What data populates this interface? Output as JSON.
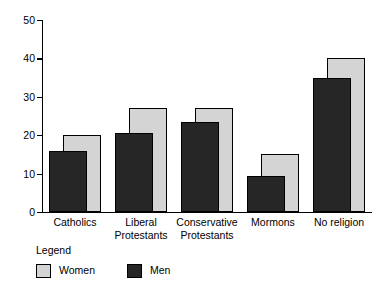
{
  "chart_data": {
    "type": "bar",
    "title": "",
    "subtitle": "",
    "xlabel": "",
    "ylabel": "",
    "ylim": [
      0,
      50
    ],
    "yticks": [
      0,
      10,
      20,
      30,
      40,
      50
    ],
    "grid": false,
    "legend_position": "below-left",
    "legend_title": "Legend",
    "categories": [
      "Catholics",
      "Liberal Protestants",
      "Conservative Protestants",
      "Mormons",
      "No religion"
    ],
    "category_lines": [
      [
        "Catholics"
      ],
      [
        "Liberal",
        "Protestants"
      ],
      [
        "Conservative",
        "Protestants"
      ],
      [
        "Mormons"
      ],
      [
        "No religion"
      ]
    ],
    "series": [
      {
        "name": "Women",
        "color": "#d4d4d4",
        "values": [
          20,
          27,
          27,
          15,
          40
        ]
      },
      {
        "name": "Men",
        "color": "#262626",
        "values": [
          16,
          20.5,
          23.5,
          9.3,
          34.8
        ]
      }
    ]
  },
  "axis": {
    "y_tick_labels": [
      "0",
      "10",
      "20",
      "30",
      "40",
      "50"
    ]
  },
  "legend": {
    "title": "Legend",
    "items": [
      {
        "label": "Women",
        "color": "#d4d4d4"
      },
      {
        "label": "Men",
        "color": "#262626"
      }
    ]
  }
}
